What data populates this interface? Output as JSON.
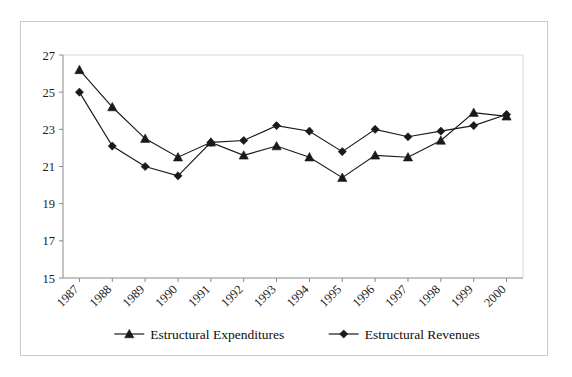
{
  "chart_data": {
    "type": "line",
    "title": "",
    "subtitle": "",
    "xlabel": "",
    "ylabel": "",
    "categories": [
      "1987",
      "1988",
      "1989",
      "1990",
      "1991",
      "1992",
      "1993",
      "1994",
      "1995",
      "1996",
      "1997",
      "1998",
      "1999",
      "2000"
    ],
    "series": [
      {
        "name": "Estructural Expenditures",
        "marker": "triangle",
        "color": "#1a1a1a",
        "values": [
          26.2,
          24.2,
          22.5,
          21.5,
          22.3,
          21.6,
          22.1,
          21.5,
          20.4,
          21.6,
          21.5,
          22.4,
          23.9,
          23.7
        ]
      },
      {
        "name": "Estructural Revenues",
        "marker": "diamond",
        "color": "#1a1a1a",
        "values": [
          25.0,
          22.1,
          21.0,
          20.5,
          22.3,
          22.4,
          23.2,
          22.9,
          21.8,
          23.0,
          22.6,
          22.9,
          23.2,
          23.8
        ]
      }
    ],
    "ylim": [
      15,
      27
    ],
    "yticks": [
      15,
      17,
      19,
      21,
      23,
      25,
      27
    ],
    "ytick_labels": [
      "15",
      "17",
      "19",
      "21",
      "23",
      "25",
      "27"
    ],
    "xtick_labels": [
      "1987",
      "1988",
      "1989",
      "1990",
      "1991",
      "1992",
      "1993",
      "1994",
      "1995",
      "1996",
      "1997",
      "1998",
      "1999",
      "2000"
    ],
    "xtick_rotation": 45,
    "grid": false,
    "legend_position": "bottom",
    "legend_entries": [
      {
        "label": "Estructural Expenditures",
        "marker": "triangle"
      },
      {
        "label": "Estructural Revenues",
        "marker": "diamond"
      }
    ]
  },
  "figure": {
    "background": "#ffffff",
    "border_color": "#c9c9c9",
    "axis_color": "#8a8a8a",
    "ink_color": "#1a1a1a"
  }
}
